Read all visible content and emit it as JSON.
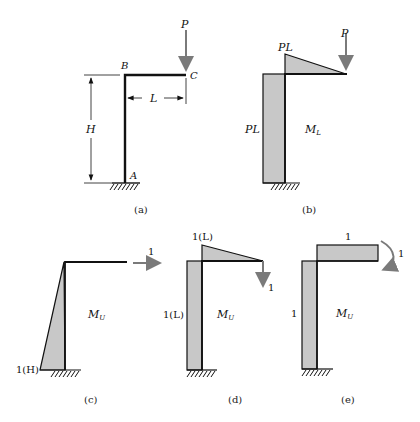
{
  "figure": {
    "panels": [
      {
        "id": "a",
        "caption": "(a)",
        "labels": {
          "load": "P",
          "joint_b": "B",
          "joint_c": "C",
          "support_a": "A",
          "height": "H",
          "length": "L"
        }
      },
      {
        "id": "b",
        "caption": "(b)",
        "labels": {
          "load": "P",
          "beam_moment": "PL",
          "column_moment": "PL",
          "diagram_name": "M",
          "diagram_sub": "L"
        }
      },
      {
        "id": "c",
        "caption": "(c)",
        "labels": {
          "unit_load": "1",
          "base_moment": "1(H)",
          "diagram_name": "M",
          "diagram_sub": "U"
        }
      },
      {
        "id": "d",
        "caption": "(d)",
        "labels": {
          "unit_load": "1",
          "beam_moment": "1(L)",
          "column_moment": "1(L)",
          "diagram_name": "M",
          "diagram_sub": "U"
        }
      },
      {
        "id": "e",
        "caption": "(e)",
        "labels": {
          "unit_moment": "1",
          "beam_moment": "1",
          "column_moment": "1",
          "diagram_name": "M",
          "diagram_sub": "U"
        }
      }
    ],
    "colors": {
      "member": "#111111",
      "shading": "#c8c8c8",
      "load_arrow": "#7a7a7a",
      "background": "#ffffff"
    }
  }
}
